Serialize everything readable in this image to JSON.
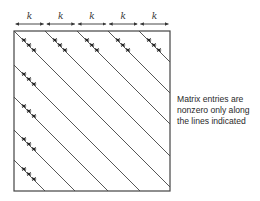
{
  "diagram": {
    "type": "banded-matrix",
    "segment_label": "k",
    "segment_count": 5,
    "caption_lines": [
      "Matrix entries are",
      "nonzero only along",
      "the lines indicated"
    ],
    "square": {
      "x": 14,
      "y": 31,
      "w": 156,
      "h": 160
    },
    "top_line_starts_x": [
      14,
      45,
      77,
      108,
      139
    ],
    "left_line_starts_y": [
      65,
      97,
      130,
      160
    ],
    "line_color": "#444444"
  }
}
